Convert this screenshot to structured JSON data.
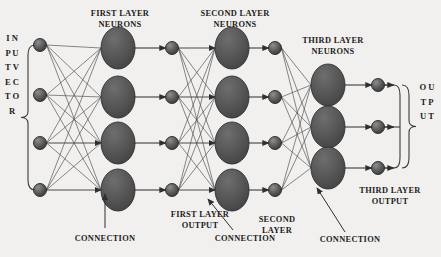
{
  "figure": {
    "background_color": "#f2f0ee",
    "ink_color": "#3a3a3a",
    "node_fill": "#555555",
    "node_stroke": "#2b2b2b"
  },
  "labels": {
    "input_vector": "I\nN\nP\nU\nT\n\nV\nE\nC\nT\nO\nR",
    "output": "O\nU\nT\nP\nU\nT",
    "first_layer_neurons": "FIRST LAYER\nNEURONS",
    "second_layer_neurons": "SECOND LAYER\nNEURONS",
    "third_layer_neurons": "THIRD LAYER\nNEURONS",
    "first_layer_output": "FIRST LAYER\nOUTPUT",
    "second_layer": "SECOND\nLAYER",
    "third_layer_output": "THIRD LAYER\nOUTPUT",
    "connection_1": "CONNECTION",
    "connection_2": "CONNECTION",
    "connection_3": "CONNECTION"
  },
  "network": {
    "layers": [
      {
        "name": "input-vector-nodes",
        "kind": "small-node",
        "x": 40,
        "radius": 6.5,
        "y": [
          45,
          95,
          143,
          190
        ]
      },
      {
        "name": "first-layer-neurons",
        "kind": "large-neuron",
        "x": 118,
        "rx": 17,
        "ry": 21,
        "y": [
          48,
          97,
          143,
          190
        ]
      },
      {
        "name": "first-layer-output-nodes",
        "kind": "small-node",
        "x": 172,
        "radius": 6.5,
        "y": [
          48,
          97,
          143,
          190
        ]
      },
      {
        "name": "second-layer-neurons",
        "kind": "large-neuron",
        "x": 232,
        "rx": 17,
        "ry": 21,
        "y": [
          48,
          97,
          143,
          190
        ]
      },
      {
        "name": "second-layer-output-nodes",
        "kind": "small-node",
        "x": 275,
        "radius": 6.5,
        "y": [
          48,
          97,
          143,
          190
        ]
      },
      {
        "name": "third-layer-neurons",
        "kind": "large-neuron",
        "x": 328,
        "rx": 17,
        "ry": 21,
        "y": [
          85,
          127,
          168
        ]
      },
      {
        "name": "third-layer-output-nodes",
        "kind": "small-node",
        "x": 378,
        "radius": 6.5,
        "y": [
          85,
          127,
          168
        ]
      }
    ],
    "connection_blocks": [
      {
        "name": "input-to-first-layer",
        "from": 0,
        "to": 1,
        "style": "fan"
      },
      {
        "name": "first-neuron-to-first-output",
        "from": 1,
        "to": 2,
        "style": "direct-arrow"
      },
      {
        "name": "first-output-to-second-layer",
        "from": 2,
        "to": 3,
        "style": "fan"
      },
      {
        "name": "second-neuron-to-second-output",
        "from": 3,
        "to": 4,
        "style": "direct-arrow"
      },
      {
        "name": "second-output-to-third-layer",
        "from": 4,
        "to": 5,
        "style": "fan"
      },
      {
        "name": "third-neuron-to-third-output",
        "from": 5,
        "to": 6,
        "style": "direct-arrow"
      }
    ]
  },
  "annotations": [
    {
      "name": "connection-arrow-1",
      "type": "vertical",
      "x1": 105,
      "y1": 228,
      "x2": 105,
      "y2": 194
    },
    {
      "name": "connection-arrow-2",
      "type": "diagonal",
      "x1": 233,
      "y1": 230,
      "x2": 208,
      "y2": 199
    },
    {
      "name": "connection-arrow-3",
      "type": "diagonal",
      "x1": 345,
      "y1": 232,
      "x2": 317,
      "y2": 188
    }
  ],
  "braces": {
    "input": {
      "name": "input-brace",
      "x": 28,
      "y_top": 45,
      "y_bottom": 190
    },
    "output": {
      "name": "output-brace",
      "x": 409,
      "y_top": 85,
      "y_bottom": 168
    }
  }
}
